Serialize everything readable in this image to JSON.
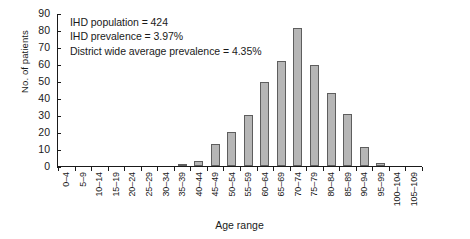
{
  "chart_data": {
    "type": "bar",
    "title": "",
    "xlabel": "Age range",
    "ylabel": "No. of patients",
    "categories": [
      "0–4",
      "5–9",
      "10–14",
      "15–19",
      "20–24",
      "25–29",
      "30–34",
      "35–39",
      "40–44",
      "45–49",
      "50–54",
      "55–59",
      "60–64",
      "65–69",
      "70–74",
      "75–79",
      "80–84",
      "85–89",
      "90–94",
      "95–99",
      "100–104",
      "105–109"
    ],
    "values": [
      0,
      0,
      0,
      0,
      0,
      0,
      0,
      1,
      3,
      13,
      20,
      30,
      50,
      62,
      82,
      60,
      43,
      31,
      11,
      2,
      0,
      0
    ],
    "ylim": [
      0,
      90
    ],
    "ytick_values": [
      0,
      10,
      20,
      30,
      40,
      50,
      60,
      70,
      80,
      90
    ],
    "ytick_labels": [
      "0",
      "10",
      "20",
      "30",
      "40",
      "50",
      "60",
      "70",
      "80",
      "90"
    ],
    "grid": false,
    "legend": null,
    "bar_color": "#b6b6b6",
    "bar_edge_color": "#5e5e5e",
    "annotations": [
      "IHD population = 424",
      "IHD prevalence = 3.97%",
      "District wide average prevalence = 4.35%"
    ]
  }
}
